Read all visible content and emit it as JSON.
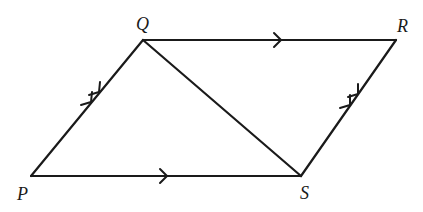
{
  "diagram": {
    "type": "parallelogram",
    "vertices": [
      {
        "id": "P",
        "label": "P",
        "x": 31,
        "y": 176
      },
      {
        "id": "Q",
        "label": "Q",
        "x": 143,
        "y": 40
      },
      {
        "id": "R",
        "label": "R",
        "x": 396,
        "y": 40
      },
      {
        "id": "S",
        "label": "S",
        "x": 301,
        "y": 176
      }
    ],
    "edges": [
      {
        "from": "P",
        "to": "Q",
        "marker": "double-arrow"
      },
      {
        "from": "Q",
        "to": "R",
        "marker": "single-arrow"
      },
      {
        "from": "S",
        "to": "R",
        "marker": "double-arrow"
      },
      {
        "from": "P",
        "to": "S",
        "marker": "single-arrow"
      },
      {
        "from": "Q",
        "to": "S",
        "marker": "none",
        "role": "diagonal"
      }
    ],
    "labels": {
      "P": "P",
      "Q": "Q",
      "R": "R",
      "S": "S"
    }
  }
}
